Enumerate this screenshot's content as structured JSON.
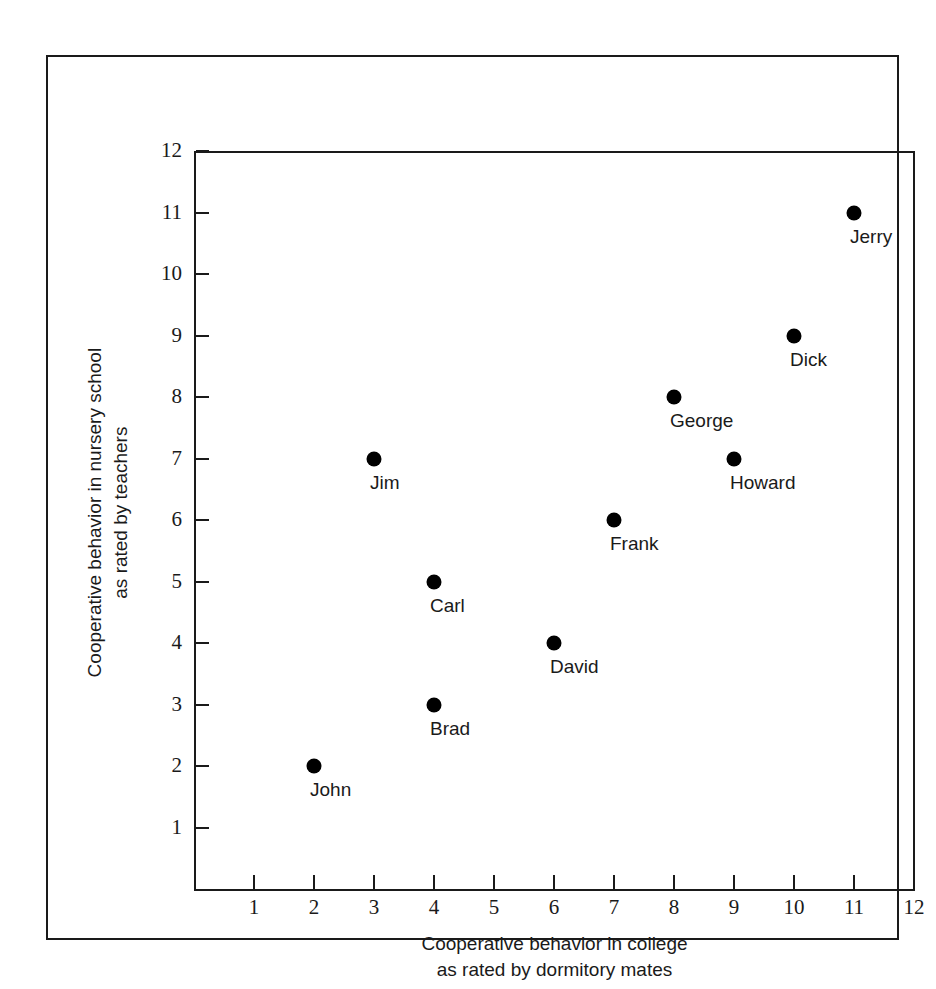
{
  "chart_data": {
    "type": "scatter",
    "title": "",
    "xlabel": "Cooperative behavior in college\nas rated by dormitory mates",
    "ylabel": "Cooperative behavior in nursery school\nas rated by teachers",
    "xlabel_lines": [
      "Cooperative behavior in college",
      "as rated by dormitory mates"
    ],
    "ylabel_lines": [
      "Cooperative behavior in nursery school",
      "as rated by  teachers"
    ],
    "xlim": [
      0,
      12
    ],
    "ylim": [
      0,
      12
    ],
    "xticks": [
      "1",
      "2",
      "3",
      "4",
      "5",
      "6",
      "7",
      "8",
      "9",
      "10",
      "11",
      "12"
    ],
    "yticks": [
      "1",
      "2",
      "3",
      "4",
      "5",
      "6",
      "7",
      "8",
      "9",
      "10",
      "11",
      "12"
    ],
    "grid": false,
    "legend": "none",
    "marker_color": "#000000",
    "axis_color": "#1a1a1a",
    "points": [
      {
        "label": "John",
        "x": 2,
        "y": 2
      },
      {
        "label": "Brad",
        "x": 4,
        "y": 3
      },
      {
        "label": "David",
        "x": 6,
        "y": 4
      },
      {
        "label": "Carl",
        "x": 4,
        "y": 5
      },
      {
        "label": "Frank",
        "x": 7,
        "y": 6
      },
      {
        "label": "Jim",
        "x": 3,
        "y": 7
      },
      {
        "label": "Howard",
        "x": 9,
        "y": 7
      },
      {
        "label": "George",
        "x": 8,
        "y": 8
      },
      {
        "label": "Dick",
        "x": 10,
        "y": 9
      },
      {
        "label": "Jerry",
        "x": 11,
        "y": 11
      }
    ]
  }
}
